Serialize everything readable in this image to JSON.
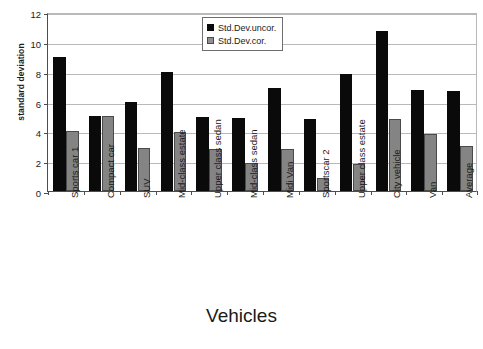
{
  "chart_data": {
    "type": "bar",
    "title": "",
    "xlabel": "Vehicles",
    "ylabel": "standard deviation",
    "ylim": [
      0,
      12
    ],
    "yticks": [
      0,
      2,
      4,
      6,
      8,
      10,
      12
    ],
    "grid": true,
    "legend_position": "top-center",
    "categories": [
      "Sports car 1",
      "Compact car",
      "SUV",
      "Mid-class estate",
      "Upper class sedan",
      "Mid-class sedan",
      "Midi Van",
      "Sportscar 2",
      "Upper class estate",
      "City vehicle",
      "Van",
      "Average"
    ],
    "series": [
      {
        "name": "Std.Dev.uncor.",
        "color": "#0a0a0a",
        "values": [
          9.0,
          5.0,
          6.0,
          8.0,
          4.95,
          4.9,
          6.9,
          4.85,
          7.85,
          10.75,
          6.8,
          6.7
        ]
      },
      {
        "name": "Std.Dev.cor.",
        "color": "#848484",
        "values": [
          4.0,
          5.0,
          2.9,
          3.95,
          2.85,
          1.85,
          2.85,
          0.85,
          1.8,
          4.8,
          3.8,
          3.05
        ]
      }
    ]
  },
  "legend": {
    "items": [
      {
        "label": "Std.Dev.uncor."
      },
      {
        "label": "Std.Dev.cor."
      }
    ]
  }
}
